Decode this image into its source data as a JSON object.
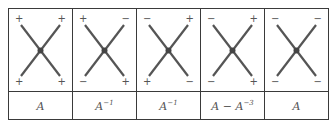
{
  "diagram": {
    "type": "crossing-sign-table",
    "columns": [
      {
        "signs": {
          "top_left": "+",
          "top_right": "+",
          "bottom_left": "+",
          "bottom_right": "+"
        },
        "label_base": "A",
        "label_exp": "",
        "label_rest": ""
      },
      {
        "signs": {
          "top_left": "+",
          "top_right": "−",
          "bottom_left": "−",
          "bottom_right": "+"
        },
        "label_base": "A",
        "label_exp": "−1",
        "label_rest": ""
      },
      {
        "signs": {
          "top_left": "−",
          "top_right": "+",
          "bottom_left": "+",
          "bottom_right": "−"
        },
        "label_base": "A",
        "label_exp": "−1",
        "label_rest": ""
      },
      {
        "signs": {
          "top_left": "−",
          "top_right": "+",
          "bottom_left": "−",
          "bottom_right": "+"
        },
        "label_base": "A − A",
        "label_exp": "−3",
        "label_rest": ""
      },
      {
        "signs": {
          "top_left": "−",
          "top_right": "−",
          "bottom_left": "−",
          "bottom_right": "−"
        },
        "label_base": "A",
        "label_exp": "",
        "label_rest": ""
      }
    ],
    "line_color": "#555555"
  }
}
